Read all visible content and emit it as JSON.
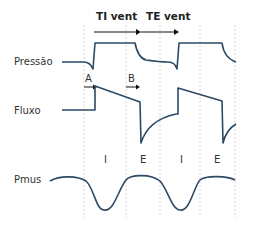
{
  "header": {
    "ti_label": "TI vent",
    "te_label": "TE vent"
  },
  "signals": {
    "pressure_label": "Pressão",
    "flow_label": "Fluxo",
    "pmus_label": "Pmus"
  },
  "markers": {
    "a_label": "A",
    "b_label": "B"
  },
  "phases": [
    {
      "label": "I"
    },
    {
      "label": "E"
    },
    {
      "label": "I"
    },
    {
      "label": "E"
    }
  ],
  "colors": {
    "wave": "#2c4a66",
    "gridline": "#c8c8d6",
    "arrow": "#111111"
  }
}
